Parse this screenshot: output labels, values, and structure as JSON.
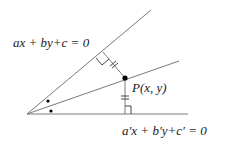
{
  "diagram": {
    "type": "angle-bisector-construction",
    "labels": {
      "line1_equation": "ax + by+c = 0",
      "line2_equation": "a′x + b′y+c′ = 0",
      "point_label": "P(x, y)"
    },
    "colors": {
      "line": "#7a7a7a",
      "marks": "#333333",
      "point": "#000000",
      "text": "#1a1a1a"
    },
    "elements": [
      "upper line ax+by+c=0",
      "lower line a'x+b'y+c'=0",
      "angle bisector through P",
      "perpendicular from P to upper line with right-angle mark and equal-length ticks",
      "perpendicular from P to lower line with right-angle mark and equal-length ticks",
      "two dots marking equal angles at vertex"
    ]
  }
}
